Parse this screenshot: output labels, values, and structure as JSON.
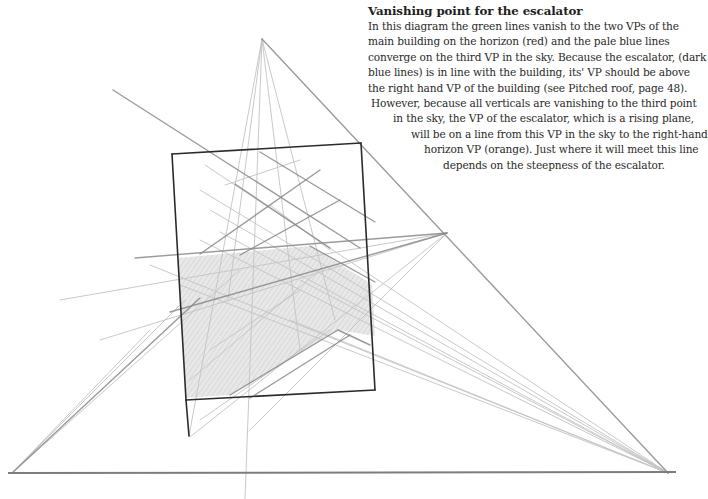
{
  "caption": {
    "title": "Vanishing point for the escalator",
    "lines": [
      {
        "text": "In this diagram the green lines vanish to the two VPs of the",
        "indent": 0
      },
      {
        "text": "main building on the horizon (red) and the pale blue lines",
        "indent": 0
      },
      {
        "text": "converge on the third VP in the sky. Because the escalator, (dark",
        "indent": 0
      },
      {
        "text": "blue lines) is in line with the building, its' VP should be above",
        "indent": 0
      },
      {
        "text": "the right hand VP of the building (see Pitched roof, page 48).",
        "indent": 0
      },
      {
        "text": "However, because all verticals are vanishing to the third point",
        "indent": 3
      },
      {
        "text": "in the sky, the VP of the escalator, which is a rising plane,",
        "indent": 25
      },
      {
        "text": "will be on a line from this VP in the sky to the right-hand",
        "indent": 43
      },
      {
        "text": "horizon VP (orange). Just where it will meet this line",
        "indent": 56
      },
      {
        "text": "depends on the steepness of the escalator.",
        "indent": 75
      }
    ]
  },
  "diagram": {
    "colors": {
      "pencil_dark": "#2b2b2b",
      "pencil_mid": "#8a8a8a",
      "pencil_light": "#c4c4c4",
      "shade": "#d8d8d8"
    },
    "vanishing_points": {
      "sky_vp": [
        262,
        39
      ],
      "left_horizon_vp": [
        12,
        473
      ],
      "right_horizon_vp": [
        668,
        473
      ],
      "escalator_vp": [
        447,
        233
      ]
    },
    "horizon": {
      "x1": 8,
      "y1": 473,
      "x2": 676,
      "y2": 472
    },
    "building_outline": [
      [
        172,
        154
      ],
      [
        361,
        143
      ],
      [
        375,
        390
      ],
      [
        186,
        400
      ]
    ],
    "shaded_escalator": [
      [
        178,
        258
      ],
      [
        310,
        246
      ],
      [
        372,
        284
      ],
      [
        375,
        336
      ],
      [
        338,
        330
      ],
      [
        230,
        395
      ],
      [
        186,
        398
      ]
    ],
    "dark_lines": [
      [
        172,
        154,
        361,
        143
      ],
      [
        361,
        143,
        375,
        390
      ],
      [
        375,
        390,
        186,
        400
      ],
      [
        186,
        400,
        172,
        154
      ],
      [
        186,
        400,
        189,
        436
      ]
    ],
    "mid_lines": [
      [
        262,
        39,
        668,
        473
      ],
      [
        113,
        90,
        360,
        248
      ],
      [
        135,
        258,
        447,
        233
      ],
      [
        170,
        312,
        447,
        233
      ],
      [
        310,
        246,
        375,
        282
      ],
      [
        260,
        152,
        375,
        222
      ],
      [
        235,
        184,
        330,
        248
      ],
      [
        200,
        254,
        320,
        170
      ],
      [
        240,
        255,
        340,
        200
      ],
      [
        338,
        330,
        370,
        345
      ],
      [
        230,
        395,
        338,
        330
      ],
      [
        250,
        398,
        350,
        335
      ],
      [
        12,
        473,
        200,
        298
      ]
    ],
    "light_lines": [
      [
        262,
        39,
        189,
        436
      ],
      [
        262,
        39,
        245,
        499
      ],
      [
        262,
        39,
        300,
        350
      ],
      [
        262,
        39,
        335,
        320
      ],
      [
        262,
        39,
        228,
        300
      ],
      [
        12,
        473,
        185,
        300
      ],
      [
        12,
        473,
        240,
        270
      ],
      [
        12,
        473,
        150,
        330
      ],
      [
        100,
        340,
        447,
        233
      ],
      [
        60,
        300,
        447,
        233
      ],
      [
        190,
        437,
        447,
        233
      ],
      [
        250,
        430,
        447,
        233
      ],
      [
        205,
        165,
        668,
        473
      ],
      [
        200,
        190,
        668,
        473
      ],
      [
        210,
        210,
        668,
        473
      ],
      [
        220,
        232,
        668,
        473
      ],
      [
        150,
        265,
        668,
        473
      ],
      [
        180,
        285,
        668,
        473
      ],
      [
        300,
        280,
        668,
        473
      ],
      [
        290,
        320,
        668,
        473
      ],
      [
        200,
        240,
        668,
        473
      ],
      [
        270,
        205,
        330,
        250
      ],
      [
        225,
        185,
        300,
        160
      ],
      [
        210,
        350,
        300,
        290
      ],
      [
        190,
        380,
        320,
        270
      ],
      [
        200,
        420,
        330,
        330
      ]
    ]
  }
}
